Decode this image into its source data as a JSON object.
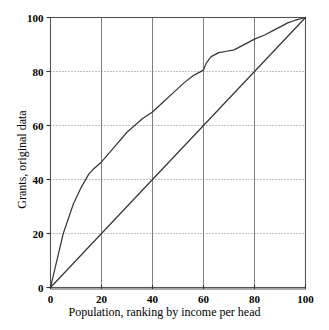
{
  "chart_data": {
    "type": "line",
    "title": "",
    "xlabel": "Population, ranking by income per head",
    "ylabel": "Grants, original data",
    "xlim": [
      0,
      100
    ],
    "ylim": [
      0,
      100
    ],
    "xticks": [
      0,
      20,
      40,
      60,
      80,
      100
    ],
    "yticks": [
      0,
      20,
      40,
      60,
      80,
      100
    ],
    "xtick_labels": [
      "0",
      "20",
      "40",
      "60",
      "80",
      "100"
    ],
    "ytick_labels": [
      "0",
      "20",
      "40",
      "60",
      "80",
      "100"
    ],
    "grid": {
      "vertical": "solid",
      "horizontal": "dotted",
      "color": "#808080"
    },
    "legend": null,
    "series": [
      {
        "name": "Grants, original data",
        "style": "solid",
        "color": "#333333",
        "points": [
          [
            0,
            0
          ],
          [
            2,
            8
          ],
          [
            5,
            20
          ],
          [
            9,
            31
          ],
          [
            12,
            37
          ],
          [
            15,
            42
          ],
          [
            17,
            44
          ],
          [
            20,
            46.5
          ],
          [
            25,
            52
          ],
          [
            30,
            57.5
          ],
          [
            33,
            60
          ],
          [
            36,
            62.5
          ],
          [
            40,
            65
          ],
          [
            44,
            68.5
          ],
          [
            48,
            72
          ],
          [
            52,
            75.5
          ],
          [
            56,
            78.5
          ],
          [
            58,
            79.5
          ],
          [
            60,
            80.5
          ],
          [
            61,
            83
          ],
          [
            63,
            85.5
          ],
          [
            66,
            87
          ],
          [
            69,
            87.5
          ],
          [
            72,
            88
          ],
          [
            75,
            89.5
          ],
          [
            80,
            92
          ],
          [
            84,
            93.5
          ],
          [
            88,
            95.5
          ],
          [
            91,
            97
          ],
          [
            93,
            98
          ],
          [
            96,
            99
          ],
          [
            100,
            100
          ]
        ]
      },
      {
        "name": "equality line",
        "style": "solid",
        "color": "#333333",
        "points": [
          [
            0,
            0
          ],
          [
            100,
            100
          ]
        ]
      }
    ]
  }
}
